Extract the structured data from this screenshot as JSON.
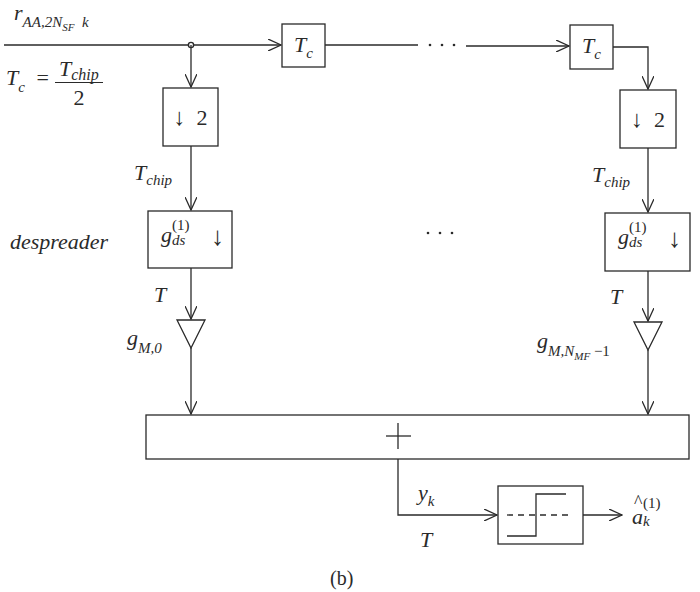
{
  "diagram": {
    "type": "block-diagram",
    "caption": "(b)",
    "input": {
      "symbol": "r",
      "subscript": "AA,2N",
      "subsub": "SF",
      "index": "k"
    },
    "rate_equation": {
      "lhs": "T",
      "lhs_sub": "c",
      "equals": "=",
      "numerator": "T",
      "numerator_sub": "chip",
      "denominator": "2"
    },
    "delay_blocks": [
      {
        "label": "T",
        "sub": "c"
      },
      {
        "label": "T",
        "sub": "c"
      }
    ],
    "ellipsis_horizontal": "· · ·",
    "ellipsis_middle": "· · ·",
    "branches": [
      {
        "downsampler": {
          "arrow": "↓",
          "factor": "2"
        },
        "rate_after_downsampler": {
          "symbol": "T",
          "sub": "chip"
        },
        "despreader": {
          "symbol": "g",
          "sub": "ds",
          "sup": "(1)",
          "arrow": "↓"
        },
        "rate_after_despreader": "T",
        "gain": {
          "symbol": "g",
          "sub": "M,0"
        }
      },
      {
        "downsampler": {
          "arrow": "↓",
          "factor": "2"
        },
        "rate_after_downsampler": {
          "symbol": "T",
          "sub": "chip"
        },
        "despreader": {
          "symbol": "g",
          "sub": "ds",
          "sup": "(1)",
          "arrow": "↓"
        },
        "rate_after_despreader": "T",
        "gain": {
          "symbol": "g",
          "sub": "M,N",
          "subsub": "MF",
          "suffix": " −1"
        }
      }
    ],
    "despreader_label": "despreader",
    "summer": {
      "symbol": "+"
    },
    "output": {
      "signal": {
        "symbol": "y",
        "sub": "k"
      },
      "rate": "T",
      "decision": {
        "symbol": "a",
        "hat": "^",
        "sub": "k",
        "sup": "(1)"
      }
    },
    "colors": {
      "ink": "#2a2a2a",
      "background": "#ffffff"
    }
  }
}
